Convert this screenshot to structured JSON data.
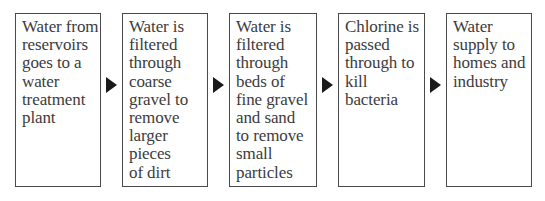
{
  "diagram": {
    "type": "flowchart",
    "direction": "left-to-right",
    "steps": [
      {
        "label": "Water from\nreservoirs\ngoes to a\nwater\ntreatment\nplant"
      },
      {
        "label": "Water is\nfiltered\nthrough\ncoarse\ngravel to\nremove\nlarger\npieces\nof dirt"
      },
      {
        "label": "Water is\nfiltered\nthrough\nbeds of\nfine gravel\nand sand\nto remove\nsmall\nparticles"
      },
      {
        "label": "Chlorine is\npassed\nthrough to\nkill\nbacteria"
      },
      {
        "label": "Water\nsupply to\nhomes and\nindustry"
      }
    ],
    "connectors": [
      {
        "from": 0,
        "to": 1,
        "icon": "triangle-right-arrow-icon"
      },
      {
        "from": 1,
        "to": 2,
        "icon": "triangle-right-arrow-icon"
      },
      {
        "from": 2,
        "to": 3,
        "icon": "triangle-right-arrow-icon"
      },
      {
        "from": 3,
        "to": 4,
        "icon": "triangle-right-arrow-icon"
      }
    ],
    "colors": {
      "border": "#4a4a4a",
      "text": "#3c3c3c",
      "arrow": "#1a1a1a",
      "background": "#ffffff"
    }
  }
}
